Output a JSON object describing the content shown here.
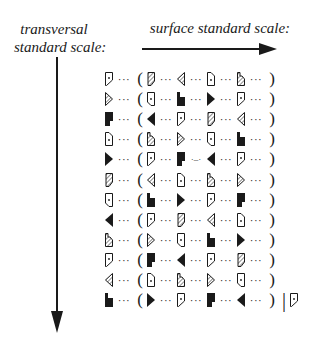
{
  "labels": {
    "transversal": "transversal standard scale:",
    "transversal_line1": "transversal",
    "transversal_line2": "standard scale:",
    "surface": "surface standard scale:"
  },
  "symbols": {
    "A": "open-pentagon-dot",
    "B": "hatched-chevron-right",
    "C": "black-block-notch",
    "D": "open-pentagon-dot-cut",
    "E": "black-wedge-right",
    "F": "hatched-slant-rect",
    "G": "hatched-wedge-left",
    "H": "black-wedge-left",
    "I": "hatched-notch",
    "J": "black-step",
    "K": "open-rect-dot"
  },
  "rows": [
    {
      "lead": "A",
      "seq": [
        "F",
        "G",
        "D",
        "I"
      ]
    },
    {
      "lead": "B",
      "seq": [
        "K",
        "J",
        "E",
        "A"
      ]
    },
    {
      "lead": "C",
      "seq": [
        "H",
        "A",
        "F",
        "G"
      ]
    },
    {
      "lead": "D",
      "seq": [
        "I",
        "B",
        "K",
        "J"
      ]
    },
    {
      "lead": "E",
      "seq": [
        "A",
        "C",
        "H",
        "A"
      ],
      "connector_after": 1,
      "connector": "·–·"
    },
    {
      "lead": "F",
      "seq": [
        "G",
        "D",
        "I",
        "B"
      ]
    },
    {
      "lead": "K",
      "seq": [
        "J",
        "E",
        "A",
        "C"
      ]
    },
    {
      "lead": "H",
      "seq": [
        "A",
        "F",
        "G",
        "D"
      ]
    },
    {
      "lead": "I",
      "seq": [
        "B",
        "K",
        "J",
        "E"
      ]
    },
    {
      "lead": "A",
      "seq": [
        "C",
        "H",
        "A",
        "F"
      ]
    },
    {
      "lead": "G",
      "seq": [
        "D",
        "I",
        "B",
        "K"
      ]
    },
    {
      "lead": "J",
      "seq": [
        "E",
        "A",
        "C",
        "H"
      ],
      "tail": "A"
    }
  ],
  "glyphs": {
    "ellipsis": "···",
    "open_paren": "(",
    "close_paren": ")",
    "separator": "|"
  }
}
